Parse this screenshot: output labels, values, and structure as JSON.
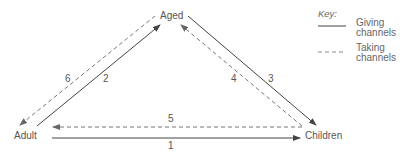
{
  "nodes": {
    "aged": "Aged",
    "adult": "Adult",
    "children": "Children"
  },
  "channels": [
    {
      "id": "1",
      "label": "1",
      "from": "Adult",
      "to": "Children",
      "type": "giving"
    },
    {
      "id": "2",
      "label": "2",
      "from": "Adult",
      "to": "Aged",
      "type": "giving"
    },
    {
      "id": "3",
      "label": "3",
      "from": "Aged",
      "to": "Children",
      "type": "giving"
    },
    {
      "id": "4",
      "label": "4",
      "from": "Children",
      "to": "Aged",
      "type": "taking"
    },
    {
      "id": "5",
      "label": "5",
      "from": "Children",
      "to": "Adult",
      "type": "taking"
    },
    {
      "id": "6",
      "label": "6",
      "from": "Aged",
      "to": "Adult",
      "type": "taking"
    }
  ],
  "key": {
    "title": "Key:",
    "giving_line1": "Giving",
    "giving_line2": "channels",
    "taking_line1": "Taking",
    "taking_line2": "channels"
  },
  "colors": {
    "solid": "#444444",
    "dashed": "#777777"
  }
}
